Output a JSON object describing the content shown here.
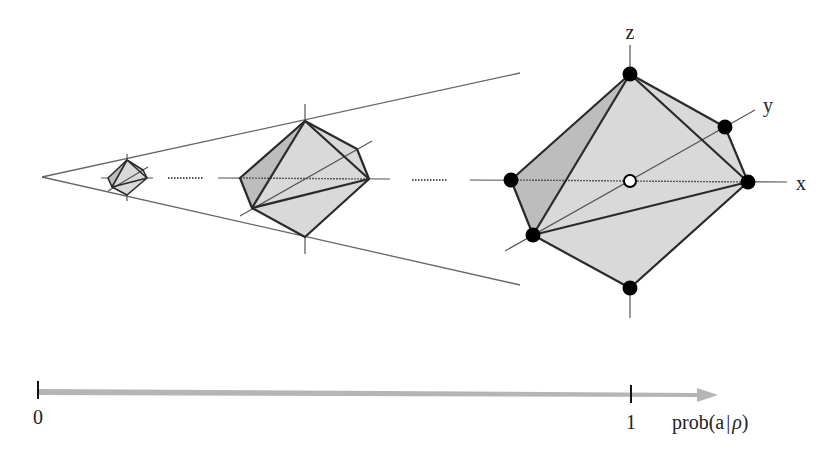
{
  "figure": {
    "type": "diagram",
    "colors": {
      "face_light": "#d9d9d9",
      "face_dark": "#bdbdbd",
      "edge": "#2a2a2a",
      "axis": "#555555",
      "arrow": "#b5b5b5",
      "vertex": "#000000"
    },
    "axes_labels": {
      "z": "z",
      "y": "y",
      "x": "x"
    },
    "octahedra": [
      {
        "name": "small",
        "center": [
          127,
          177
        ]
      },
      {
        "name": "medium",
        "center": [
          305,
          179
        ]
      },
      {
        "name": "large",
        "center": [
          630,
          180
        ],
        "vertices_marked": 6,
        "center_marker": "hollow-circle"
      }
    ],
    "ellipsis_1": "··········",
    "ellipsis_2": "··········"
  },
  "probability_axis": {
    "tick_0_label": "0",
    "tick_1_label": "1",
    "axis_label": "prob(a|ρ)",
    "axis_label_prefix": "prob(a",
    "axis_label_bar": "|",
    "axis_label_rho": "ρ",
    "axis_label_suffix": ")"
  }
}
